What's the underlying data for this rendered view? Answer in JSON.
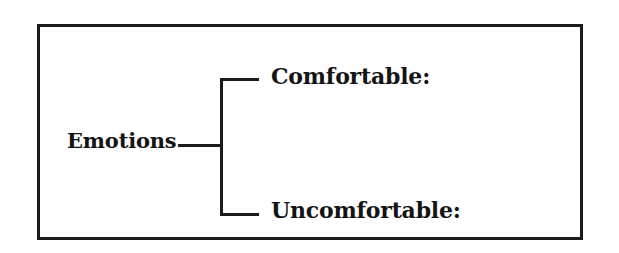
{
  "diagram": {
    "type": "bracket-tree",
    "root": {
      "label": "Emotions"
    },
    "children": [
      {
        "label": "Comfortable:"
      },
      {
        "label": "Uncomfortable:"
      }
    ],
    "colors": {
      "ink": "#1c1c1c",
      "text": "#141414",
      "background": "#ffffff"
    }
  }
}
